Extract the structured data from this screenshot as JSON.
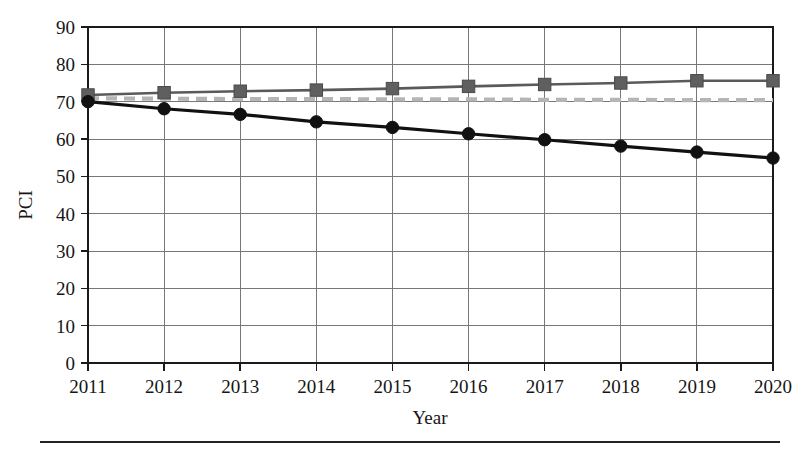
{
  "chart_data": {
    "type": "line",
    "title": "",
    "xlabel": "Year",
    "ylabel": "PCI",
    "x": [
      2011,
      2012,
      2013,
      2014,
      2015,
      2016,
      2017,
      2018,
      2019,
      2020
    ],
    "categories": [
      "2011",
      "2012",
      "2013",
      "2014",
      "2015",
      "2016",
      "2017",
      "2018",
      "2019",
      "2020"
    ],
    "xlim": [
      2011,
      2020
    ],
    "ylim": [
      0,
      90
    ],
    "y_ticks": [
      0,
      10,
      20,
      30,
      40,
      50,
      60,
      70,
      80,
      90
    ],
    "y_tick_labels": [
      "0",
      "10",
      "20",
      "30",
      "40",
      "50",
      "60",
      "70",
      "80",
      "90"
    ],
    "grid": "horizontal-and-vertical",
    "legend": "none",
    "series": [
      {
        "name": "rising-gray-square-series",
        "marker": "square",
        "linestyle": "solid",
        "color": "#5f5f5f",
        "values": [
          71.8,
          72.4,
          72.8,
          73.1,
          73.5,
          74.1,
          74.6,
          75.0,
          75.6,
          75.6
        ]
      },
      {
        "name": "declining-black-circle-series",
        "marker": "circle",
        "linestyle": "solid",
        "color": "#111111",
        "values": [
          70.0,
          68.1,
          66.6,
          64.6,
          63.1,
          61.4,
          59.8,
          58.1,
          56.5,
          54.9
        ]
      },
      {
        "name": "flat-dashed-threshold-series",
        "marker": "none",
        "linestyle": "dashed",
        "color": "#b5b5b5",
        "values": [
          70.9,
          70.8,
          70.7,
          70.7,
          70.6,
          70.6,
          70.5,
          70.5,
          70.4,
          70.4
        ]
      }
    ]
  },
  "axes": {
    "x_axis_title": "Year",
    "y_axis_title": "PCI"
  }
}
